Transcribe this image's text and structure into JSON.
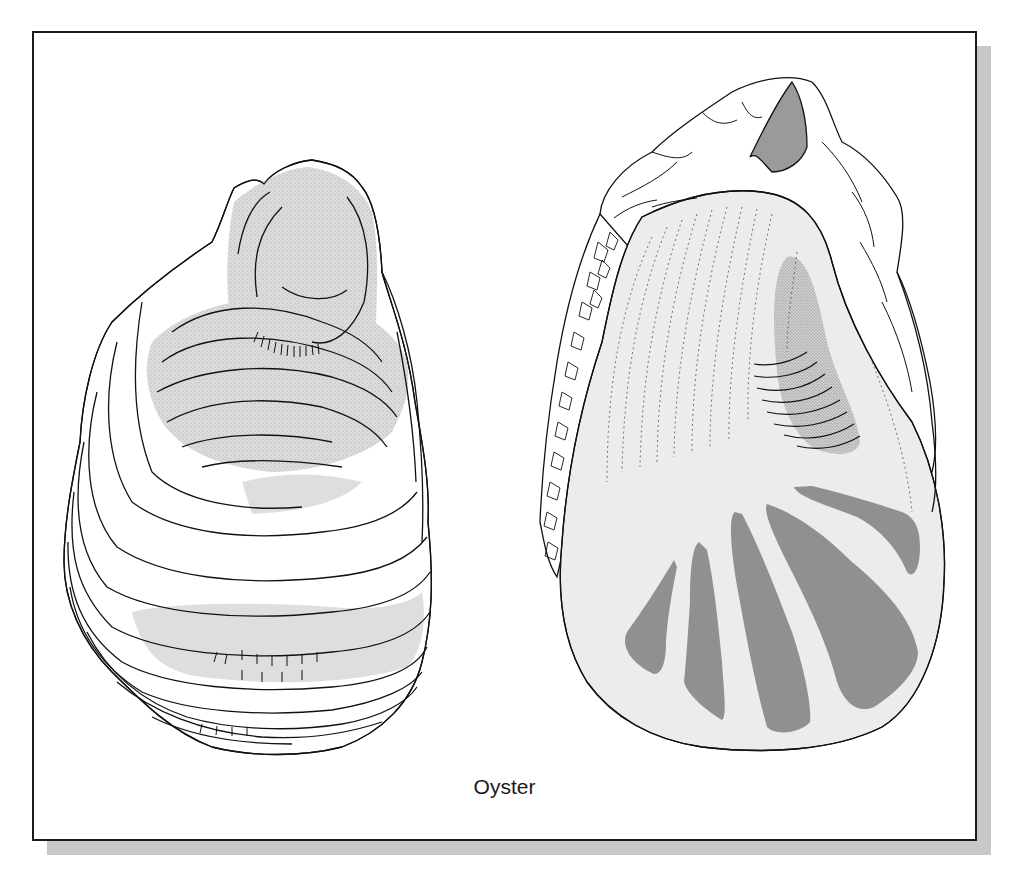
{
  "figure": {
    "caption": "Oyster",
    "colors": {
      "frame_border": "#1a1a1a",
      "shadow": "#c8c8c8",
      "background": "#ffffff",
      "shell_light_fill": "#ececec",
      "stipple_fill": "#d6d6d6",
      "muscle_scar_fill": "#909090",
      "line": "#111111"
    },
    "panels": [
      {
        "name": "oyster-shell-exterior",
        "description": "Outer (left) valve showing concentric growth layers with stippled umbo region"
      },
      {
        "name": "oyster-shell-interior",
        "description": "Inner valve showing smooth pearly interior, stippled adductor muscle scar, dark radial scar bands, and rough chalky hinge margin"
      }
    ]
  }
}
